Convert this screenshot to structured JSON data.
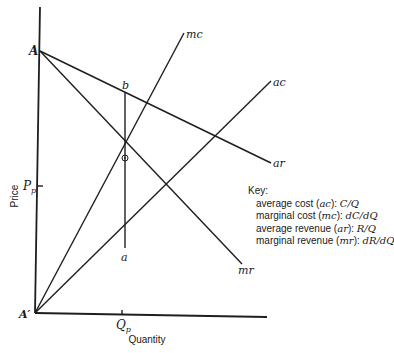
{
  "diagram": {
    "axes": {
      "y_label": "Price",
      "x_label": "Quantity",
      "origin_label": "A′",
      "y_intercept_label": "A",
      "price_tick_label": "P",
      "price_tick_sub": "p",
      "quantity_tick_label": "Q",
      "quantity_tick_sub": "p"
    },
    "curves": {
      "mc": "mc",
      "ac": "ac",
      "ar": "ar",
      "mr": "mr"
    },
    "points": {
      "b": "b",
      "a": "a"
    },
    "key": {
      "title": "Key:",
      "items": [
        {
          "name": "average cost",
          "abbr": "ac",
          "formula": "C/Q"
        },
        {
          "name": "marginal cost",
          "abbr": "mc",
          "formula": "dC/dQ"
        },
        {
          "name": "average revenue",
          "abbr": "ar",
          "formula": "R/Q"
        },
        {
          "name": "marginal revenue",
          "abbr": "mr",
          "formula": "dR/dQ"
        }
      ]
    }
  }
}
